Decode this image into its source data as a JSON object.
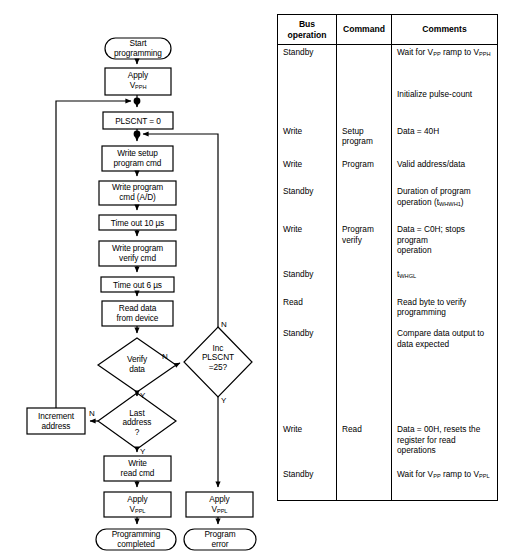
{
  "flowchart": {
    "nodes": [
      {
        "id": "start",
        "shape": "terminal",
        "lines": [
          "Start",
          "programming"
        ]
      },
      {
        "id": "apply-vpph",
        "shape": "process",
        "lines": [
          "Apply",
          "V<sub>PPH</sub>"
        ]
      },
      {
        "id": "plscnt-zero",
        "shape": "process",
        "lines": [
          "PLSCNT = 0"
        ]
      },
      {
        "id": "write-setup",
        "shape": "process",
        "lines": [
          "Write setup",
          "program cmd"
        ]
      },
      {
        "id": "write-program",
        "shape": "process",
        "lines": [
          "Write program",
          "cmd (A/D)"
        ]
      },
      {
        "id": "timeout-10us",
        "shape": "process",
        "lines": [
          "Time out 10 µs"
        ]
      },
      {
        "id": "write-verify",
        "shape": "process",
        "lines": [
          "Write program",
          "verify cmd"
        ]
      },
      {
        "id": "timeout-6us",
        "shape": "process",
        "lines": [
          "Time out 6 µs"
        ]
      },
      {
        "id": "read-data",
        "shape": "process",
        "lines": [
          "Read data",
          "from device"
        ]
      },
      {
        "id": "verify-data",
        "shape": "decision",
        "lines": [
          "Verify",
          "data"
        ]
      },
      {
        "id": "inc-plscnt",
        "shape": "decision",
        "lines": [
          "Inc",
          "PLSCNT",
          "=25?"
        ]
      },
      {
        "id": "last-address",
        "shape": "decision",
        "lines": [
          "Last",
          "address",
          "?"
        ]
      },
      {
        "id": "increment-address",
        "shape": "process",
        "lines": [
          "Increment",
          "address"
        ]
      },
      {
        "id": "write-read-cmd",
        "shape": "process",
        "lines": [
          "Write",
          "read cmd"
        ]
      },
      {
        "id": "apply-vppl-left",
        "shape": "process",
        "lines": [
          "Apply",
          "V<sub>PPL</sub>"
        ]
      },
      {
        "id": "apply-vppl-right",
        "shape": "process",
        "lines": [
          "Apply",
          "V<sub>PPL</sub>"
        ]
      },
      {
        "id": "prog-completed",
        "shape": "terminal",
        "lines": [
          "Programming",
          "completed"
        ]
      },
      {
        "id": "prog-error",
        "shape": "terminal",
        "lines": [
          "Program",
          "error"
        ]
      }
    ],
    "edge_labels": [
      {
        "id": "verify-no",
        "text": "N"
      },
      {
        "id": "verify-yes",
        "text": "Y"
      },
      {
        "id": "plscnt-no",
        "text": "N"
      },
      {
        "id": "plscnt-yes",
        "text": "Y"
      },
      {
        "id": "last-address-no",
        "text": "N"
      },
      {
        "id": "last-address-yes",
        "text": "Y"
      }
    ]
  },
  "table": {
    "headers": {
      "bus_operation": "Bus\noperation",
      "bus_operation_l1": "Bus",
      "bus_operation_l2": "operation",
      "command": "Command",
      "comments": "Comments"
    },
    "rows": [
      {
        "bus": "Standby",
        "cmd": "",
        "comment_html": "Wait for V<sub>PP</sub> ramp to V<sub>PPH</sub>"
      },
      {
        "bus": "",
        "cmd": "",
        "comment_html": "Initialize pulse-count"
      },
      {
        "bus": "Write",
        "cmd_html": "Setup<br>program",
        "comment_html": "Data = 40H"
      },
      {
        "bus": "Write",
        "cmd_html": "Program",
        "comment_html": "Valid address/data"
      },
      {
        "bus": "Standby",
        "cmd": "",
        "comment_html": "Duration of program<br>operation (t<sub>WHWH1</sub>)"
      },
      {
        "bus": "Write",
        "cmd_html": "Program<br>verify",
        "comment_html": "Data = C0H; stops program<br>operation"
      },
      {
        "bus": "Standby",
        "cmd": "",
        "comment_html": "t<sub>WHGL</sub>"
      },
      {
        "bus": "Read",
        "cmd": "",
        "comment_html": "Read byte to verify<br>programming"
      },
      {
        "bus": "Standby",
        "cmd": "",
        "comment_html": "Compare data output to<br>data expected"
      },
      {
        "bus": "",
        "cmd": "",
        "comment_html": ""
      },
      {
        "bus": "Write",
        "cmd_html": "Read",
        "comment_html": "Data = 00H, resets the<br>register for read operations"
      },
      {
        "bus": "Standby",
        "cmd": "",
        "comment_html": "Wait for V<sub>PP</sub> ramp to V<sub>PPL</sub>"
      }
    ]
  },
  "colors": {
    "line": "#000000",
    "background": "#ffffff",
    "text": "#000000"
  }
}
